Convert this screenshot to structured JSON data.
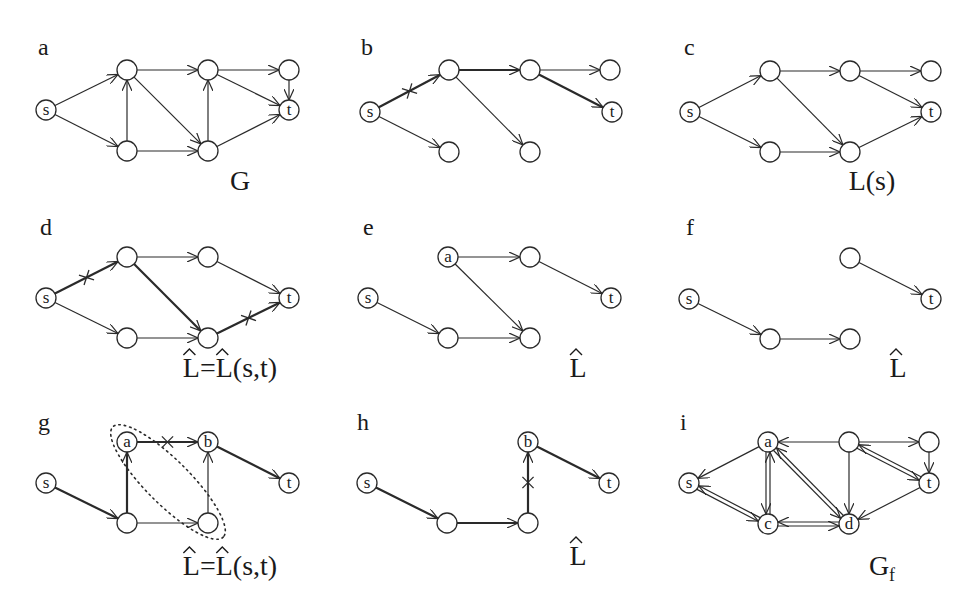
{
  "figure": {
    "style": {
      "stroke": "#2a2a2a",
      "background": "#ffffff",
      "node_radius": 10
    },
    "panels": [
      {
        "id": "a",
        "letter": "a",
        "origin": [
          0,
          0
        ],
        "letter_pos": [
          38,
          55
        ],
        "caption": {
          "text": "G",
          "sub": "",
          "hat": false,
          "pos": [
            240,
            190
          ]
        },
        "nodes": [
          {
            "id": "s",
            "x": 46,
            "y": 110,
            "label": "s"
          },
          {
            "id": "n1",
            "x": 127,
            "y": 70,
            "label": ""
          },
          {
            "id": "n2",
            "x": 127,
            "y": 151,
            "label": ""
          },
          {
            "id": "n3",
            "x": 208,
            "y": 70,
            "label": ""
          },
          {
            "id": "n4",
            "x": 208,
            "y": 151,
            "label": ""
          },
          {
            "id": "n5",
            "x": 289,
            "y": 70,
            "label": ""
          },
          {
            "id": "t",
            "x": 289,
            "y": 110,
            "label": "t"
          }
        ],
        "edges": [
          {
            "from": "s",
            "to": "n1"
          },
          {
            "from": "s",
            "to": "n2"
          },
          {
            "from": "n2",
            "to": "n1"
          },
          {
            "from": "n1",
            "to": "n3"
          },
          {
            "from": "n1",
            "to": "n4"
          },
          {
            "from": "n2",
            "to": "n4"
          },
          {
            "from": "n4",
            "to": "n3"
          },
          {
            "from": "n3",
            "to": "n5"
          },
          {
            "from": "n3",
            "to": "t"
          },
          {
            "from": "n4",
            "to": "t"
          },
          {
            "from": "n5",
            "to": "t"
          }
        ]
      },
      {
        "id": "b",
        "letter": "b",
        "origin": [
          325,
          0
        ],
        "letter_pos": [
          36,
          55
        ],
        "caption": null,
        "nodes": [
          {
            "id": "s",
            "x": 45,
            "y": 112,
            "label": "s"
          },
          {
            "id": "n1",
            "x": 124,
            "y": 70,
            "label": ""
          },
          {
            "id": "n2",
            "x": 124,
            "y": 152,
            "label": ""
          },
          {
            "id": "n3",
            "x": 205,
            "y": 70,
            "label": ""
          },
          {
            "id": "n4",
            "x": 205,
            "y": 152,
            "label": ""
          },
          {
            "id": "n5",
            "x": 285,
            "y": 70,
            "label": ""
          },
          {
            "id": "t",
            "x": 287,
            "y": 112,
            "label": "t"
          }
        ],
        "edges": [
          {
            "from": "s",
            "to": "n1",
            "bold": true,
            "cross": true
          },
          {
            "from": "s",
            "to": "n2"
          },
          {
            "from": "n1",
            "to": "n3",
            "bold": true
          },
          {
            "from": "n1",
            "to": "n4"
          },
          {
            "from": "n3",
            "to": "n5"
          },
          {
            "from": "n3",
            "to": "t",
            "bold": true
          }
        ]
      },
      {
        "id": "c",
        "letter": "c",
        "origin": [
          650,
          0
        ],
        "letter_pos": [
          34,
          55
        ],
        "caption": {
          "text": "L(s)",
          "sub": "",
          "hat": false,
          "pos": [
            222,
            190
          ]
        },
        "nodes": [
          {
            "id": "s",
            "x": 40,
            "y": 112,
            "label": "s"
          },
          {
            "id": "n1",
            "x": 120,
            "y": 71,
            "label": ""
          },
          {
            "id": "n2",
            "x": 120,
            "y": 152,
            "label": ""
          },
          {
            "id": "n3",
            "x": 200,
            "y": 71,
            "label": ""
          },
          {
            "id": "n4",
            "x": 200,
            "y": 152,
            "label": ""
          },
          {
            "id": "n5",
            "x": 281,
            "y": 71,
            "label": ""
          },
          {
            "id": "t",
            "x": 281,
            "y": 112,
            "label": "t"
          }
        ],
        "edges": [
          {
            "from": "s",
            "to": "n1"
          },
          {
            "from": "s",
            "to": "n2"
          },
          {
            "from": "n1",
            "to": "n3"
          },
          {
            "from": "n1",
            "to": "n4"
          },
          {
            "from": "n2",
            "to": "n4"
          },
          {
            "from": "n3",
            "to": "n5"
          },
          {
            "from": "n3",
            "to": "t"
          },
          {
            "from": "n4",
            "to": "t"
          }
        ]
      },
      {
        "id": "d",
        "letter": "d",
        "origin": [
          0,
          195
        ],
        "letter_pos": [
          40,
          40
        ],
        "caption": {
          "text": "L=L(s,t)",
          "sub": "",
          "hat": true,
          "pos": [
            230,
            182
          ]
        },
        "nodes": [
          {
            "id": "s",
            "x": 46,
            "y": 103,
            "label": "s"
          },
          {
            "id": "n1",
            "x": 127,
            "y": 62,
            "label": ""
          },
          {
            "id": "n2",
            "x": 127,
            "y": 143,
            "label": ""
          },
          {
            "id": "n3",
            "x": 208,
            "y": 62,
            "label": ""
          },
          {
            "id": "n4",
            "x": 208,
            "y": 143,
            "label": ""
          },
          {
            "id": "t",
            "x": 289,
            "y": 103,
            "label": "t"
          }
        ],
        "edges": [
          {
            "from": "s",
            "to": "n1",
            "bold": true,
            "cross": true
          },
          {
            "from": "s",
            "to": "n2"
          },
          {
            "from": "n1",
            "to": "n3"
          },
          {
            "from": "n1",
            "to": "n4",
            "bold": true
          },
          {
            "from": "n2",
            "to": "n4"
          },
          {
            "from": "n3",
            "to": "t"
          },
          {
            "from": "n4",
            "to": "t",
            "bold": true,
            "cross": true
          }
        ]
      },
      {
        "id": "e",
        "letter": "e",
        "origin": [
          325,
          195
        ],
        "letter_pos": [
          38,
          40
        ],
        "caption": {
          "text": "L",
          "sub": "",
          "hat": true,
          "pos": [
            253,
            182
          ]
        },
        "nodes": [
          {
            "id": "s",
            "x": 43,
            "y": 103,
            "label": "s"
          },
          {
            "id": "a",
            "x": 123,
            "y": 62,
            "label": "a"
          },
          {
            "id": "n2",
            "x": 123,
            "y": 143,
            "label": ""
          },
          {
            "id": "n3",
            "x": 205,
            "y": 62,
            "label": ""
          },
          {
            "id": "n4",
            "x": 205,
            "y": 143,
            "label": ""
          },
          {
            "id": "t",
            "x": 286,
            "y": 103,
            "label": "t"
          }
        ],
        "edges": [
          {
            "from": "s",
            "to": "n2"
          },
          {
            "from": "a",
            "to": "n3"
          },
          {
            "from": "a",
            "to": "n4"
          },
          {
            "from": "n2",
            "to": "n4"
          },
          {
            "from": "n3",
            "to": "t"
          }
        ]
      },
      {
        "id": "f",
        "letter": "f",
        "origin": [
          650,
          195
        ],
        "letter_pos": [
          36,
          40
        ],
        "caption": {
          "text": "L",
          "sub": "",
          "hat": true,
          "pos": [
            248,
            182
          ]
        },
        "nodes": [
          {
            "id": "s",
            "x": 39,
            "y": 104,
            "label": "s"
          },
          {
            "id": "n2",
            "x": 120,
            "y": 144,
            "label": ""
          },
          {
            "id": "n4",
            "x": 200,
            "y": 144,
            "label": ""
          },
          {
            "id": "n3",
            "x": 200,
            "y": 63,
            "label": ""
          },
          {
            "id": "t",
            "x": 281,
            "y": 104,
            "label": "t"
          }
        ],
        "edges": [
          {
            "from": "s",
            "to": "n2"
          },
          {
            "from": "n2",
            "to": "n4"
          },
          {
            "from": "n3",
            "to": "t"
          }
        ]
      },
      {
        "id": "g",
        "letter": "g",
        "origin": [
          0,
          395
        ],
        "letter_pos": [
          38,
          35
        ],
        "caption": {
          "text": "L=L(s,t)",
          "sub": "",
          "hat": true,
          "pos": [
            230,
            180
          ]
        },
        "nodes": [
          {
            "id": "s",
            "x": 46,
            "y": 88,
            "label": "s"
          },
          {
            "id": "a",
            "x": 127,
            "y": 47,
            "label": "a"
          },
          {
            "id": "n2",
            "x": 127,
            "y": 128,
            "label": ""
          },
          {
            "id": "b",
            "x": 208,
            "y": 47,
            "label": "b"
          },
          {
            "id": "n4",
            "x": 208,
            "y": 128,
            "label": ""
          },
          {
            "id": "t",
            "x": 289,
            "y": 88,
            "label": "t"
          }
        ],
        "edges": [
          {
            "from": "s",
            "to": "n2",
            "bold": true
          },
          {
            "from": "n2",
            "to": "a",
            "bold": true
          },
          {
            "from": "a",
            "to": "b",
            "bold": true,
            "cross": true
          },
          {
            "from": "n2",
            "to": "n4"
          },
          {
            "from": "n4",
            "to": "b"
          },
          {
            "from": "b",
            "to": "t",
            "bold": true
          }
        ],
        "ellipse": {
          "cx": 168,
          "cy": 87,
          "rx": 78,
          "ry": 22,
          "angle": 45
        }
      },
      {
        "id": "h",
        "letter": "h",
        "origin": [
          325,
          395
        ],
        "letter_pos": [
          32,
          35
        ],
        "caption": {
          "text": "L",
          "sub": "",
          "hat": true,
          "pos": [
            253,
            170
          ]
        },
        "nodes": [
          {
            "id": "s",
            "x": 42,
            "y": 88,
            "label": "s"
          },
          {
            "id": "n2",
            "x": 122,
            "y": 128,
            "label": ""
          },
          {
            "id": "n4",
            "x": 203,
            "y": 128,
            "label": ""
          },
          {
            "id": "b",
            "x": 203,
            "y": 47,
            "label": "b"
          },
          {
            "id": "t",
            "x": 284,
            "y": 88,
            "label": "t"
          }
        ],
        "edges": [
          {
            "from": "s",
            "to": "n2",
            "bold": true
          },
          {
            "from": "n2",
            "to": "n4",
            "bold": true
          },
          {
            "from": "n4",
            "to": "b",
            "bold": true,
            "cross": true
          },
          {
            "from": "b",
            "to": "t",
            "bold": true
          }
        ]
      },
      {
        "id": "i",
        "letter": "i",
        "origin": [
          650,
          395
        ],
        "letter_pos": [
          30,
          35
        ],
        "caption": {
          "text": "G",
          "sub": "f",
          "hat": false,
          "pos": [
            232,
            180
          ]
        },
        "nodes": [
          {
            "id": "s",
            "x": 39,
            "y": 88,
            "label": "s"
          },
          {
            "id": "a",
            "x": 118,
            "y": 47,
            "label": "a"
          },
          {
            "id": "c",
            "x": 118,
            "y": 129,
            "label": "c"
          },
          {
            "id": "n3",
            "x": 199,
            "y": 47,
            "label": ""
          },
          {
            "id": "d",
            "x": 199,
            "y": 129,
            "label": "d"
          },
          {
            "id": "n5",
            "x": 279,
            "y": 47,
            "label": ""
          },
          {
            "id": "t",
            "x": 279,
            "y": 88,
            "label": "t"
          }
        ],
        "edges": [
          {
            "from": "a",
            "to": "s"
          },
          {
            "from": "s",
            "to": "c",
            "double": true
          },
          {
            "from": "c",
            "to": "s",
            "double": true
          },
          {
            "from": "a",
            "to": "c",
            "double": true
          },
          {
            "from": "c",
            "to": "a",
            "double": true
          },
          {
            "from": "n3",
            "to": "a"
          },
          {
            "from": "a",
            "to": "d",
            "double": true
          },
          {
            "from": "d",
            "to": "a",
            "double": true
          },
          {
            "from": "c",
            "to": "d",
            "double": true
          },
          {
            "from": "d",
            "to": "c",
            "double": true
          },
          {
            "from": "n3",
            "to": "d"
          },
          {
            "from": "n3",
            "to": "n5"
          },
          {
            "from": "n3",
            "to": "t",
            "double": true
          },
          {
            "from": "t",
            "to": "n3",
            "double": true
          },
          {
            "from": "n5",
            "to": "t"
          },
          {
            "from": "t",
            "to": "d"
          }
        ]
      }
    ]
  }
}
